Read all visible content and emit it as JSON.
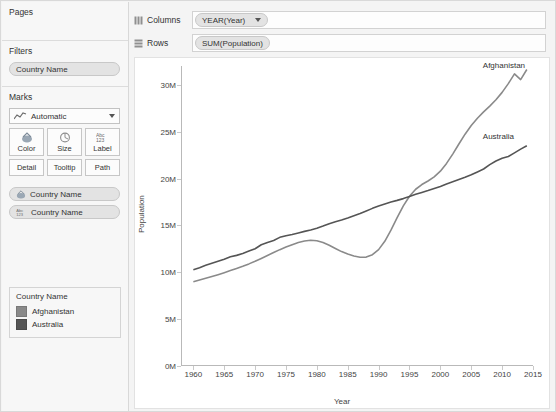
{
  "panels": {
    "pages": {
      "title": "Pages"
    },
    "filters": {
      "title": "Filters",
      "pills": [
        {
          "label": "Country Name"
        }
      ]
    },
    "marks": {
      "title": "Marks",
      "mark_type": "Automatic",
      "buttons": [
        {
          "label": "Color",
          "icon": "color-icon"
        },
        {
          "label": "Size",
          "icon": "size-icon"
        },
        {
          "label": "Label",
          "icon": "label-icon"
        },
        {
          "label": "Detail",
          "icon": "detail-icon"
        },
        {
          "label": "Tooltip",
          "icon": "tooltip-icon"
        },
        {
          "label": "Path",
          "icon": "path-icon"
        }
      ],
      "cards": [
        {
          "label": "Country Name",
          "icon": "color-icon"
        },
        {
          "label": "Country Name",
          "icon": "label-icon"
        }
      ]
    },
    "legend": {
      "title": "Country Name",
      "entries": [
        {
          "label": "Afghanistan",
          "color": "#8a8a8a"
        },
        {
          "label": "Australia",
          "color": "#555555"
        }
      ]
    }
  },
  "shelves": {
    "columns": {
      "label": "Columns",
      "field": "YEAR(Year)"
    },
    "rows": {
      "label": "Rows",
      "field": "SUM(Population)"
    }
  },
  "chart_data": {
    "type": "line",
    "title": "",
    "xlabel": "Year",
    "ylabel": "Population",
    "xlim": [
      1958,
      2015
    ],
    "ylim": [
      0,
      32000000
    ],
    "grid": false,
    "legend_position": "left-panel",
    "ytick_labels": [
      "0M",
      "5M",
      "10M",
      "15M",
      "20M",
      "25M",
      "30M"
    ],
    "ytick_values": [
      0,
      5000000,
      10000000,
      15000000,
      20000000,
      25000000,
      30000000
    ],
    "xtick_labels": [
      "1960",
      "1965",
      "1970",
      "1975",
      "1980",
      "1985",
      "1990",
      "1995",
      "2000",
      "2005",
      "2010",
      "2015"
    ],
    "xtick_values": [
      1960,
      1965,
      1970,
      1975,
      1980,
      1985,
      1990,
      1995,
      2000,
      2005,
      2010,
      2015
    ],
    "annotations": [
      {
        "text": "Afghanistan",
        "x": 2014,
        "y": 31000000
      },
      {
        "text": "Australia",
        "x": 2014,
        "y": 23500000
      }
    ],
    "series": [
      {
        "name": "Afghanistan",
        "color": "#8a8a8a",
        "x": [
          1960,
          1961,
          1962,
          1963,
          1964,
          1965,
          1966,
          1967,
          1968,
          1969,
          1970,
          1971,
          1972,
          1973,
          1974,
          1975,
          1976,
          1977,
          1978,
          1979,
          1980,
          1981,
          1982,
          1983,
          1984,
          1985,
          1986,
          1987,
          1988,
          1989,
          1990,
          1991,
          1992,
          1993,
          1994,
          1995,
          1996,
          1997,
          1998,
          1999,
          2000,
          2001,
          2002,
          2003,
          2004,
          2005,
          2006,
          2007,
          2008,
          2009,
          2010,
          2011,
          2012,
          2013,
          2014
        ],
        "y": [
          8996000,
          9170000,
          9351000,
          9543000,
          9745000,
          9956000,
          10175000,
          10399000,
          10637000,
          10893000,
          11173000,
          11475000,
          11792000,
          12109000,
          12412000,
          12689000,
          12943000,
          13171000,
          13341000,
          13411000,
          13356000,
          13171000,
          12882000,
          12537000,
          12204000,
          11938000,
          11736000,
          11604000,
          11618000,
          11868000,
          12412000,
          13299000,
          14486000,
          15817000,
          17076000,
          18111000,
          18854000,
          19357000,
          19738000,
          20171000,
          20780000,
          21607000,
          22601000,
          23681000,
          24727000,
          25654000,
          26433000,
          27101000,
          27722000,
          28395000,
          29186000,
          30117000,
          31161000,
          30552000,
          31628000
        ]
      },
      {
        "name": "Australia",
        "color": "#555555",
        "x": [
          1960,
          1961,
          1962,
          1963,
          1964,
          1965,
          1966,
          1967,
          1968,
          1969,
          1970,
          1971,
          1972,
          1973,
          1974,
          1975,
          1976,
          1977,
          1978,
          1979,
          1980,
          1981,
          1982,
          1983,
          1984,
          1985,
          1986,
          1987,
          1988,
          1989,
          1990,
          1991,
          1992,
          1993,
          1994,
          1995,
          1996,
          1997,
          1998,
          1999,
          2000,
          2001,
          2002,
          2003,
          2004,
          2005,
          2006,
          2007,
          2008,
          2009,
          2010,
          2011,
          2012,
          2013,
          2014
        ],
        "y": [
          10276000,
          10483000,
          10742000,
          10950000,
          11167000,
          11388000,
          11651000,
          11799000,
          12009000,
          12263000,
          12507000,
          12937000,
          13177000,
          13380000,
          13723000,
          13893000,
          14033000,
          14192000,
          14359000,
          14516000,
          14695000,
          14923000,
          15184000,
          15394000,
          15579000,
          15788000,
          16018000,
          16264000,
          16532000,
          16814000,
          17065000,
          17284000,
          17495000,
          17667000,
          17855000,
          18072000,
          18311000,
          18517000,
          18711000,
          18926000,
          19153000,
          19413000,
          19651000,
          19895000,
          20127000,
          20395000,
          20698000,
          21016000,
          21475000,
          21865000,
          22154000,
          22340000,
          22728000,
          23130000,
          23490000
        ]
      }
    ]
  }
}
